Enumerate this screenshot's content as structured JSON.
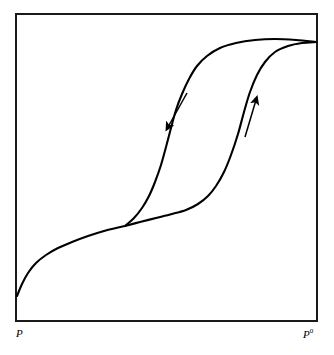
{
  "figure": {
    "type": "adsorption-isotherm-hysteresis",
    "background_color": "#ffffff",
    "line_color": "#000000",
    "frame_color": "#1a1a1a",
    "axis_labels": {
      "x_start": "P",
      "x_end_base": "P",
      "x_end_superscript": "0"
    }
  },
  "chart_data": {
    "type": "line",
    "title": "",
    "subtitle": "",
    "xlabel": "",
    "ylabel": "",
    "xlim": [
      0,
      1
    ],
    "ylim": [
      0,
      1
    ],
    "grid": false,
    "legend": null,
    "axis_tick_labels": {
      "x": [
        "P",
        "P0"
      ],
      "y": []
    },
    "frame": {
      "left_px": 16,
      "top_px": 14,
      "right_px": 317,
      "bottom_px": 321,
      "border_width_px": 2
    },
    "series": [
      {
        "name": "common-low-pressure-branch",
        "role": "shared",
        "description": "Shared low relative-pressure uptake curve rising from origin region to the hysteresis split point",
        "points_px": [
          [
            17,
            296
          ],
          [
            22,
            284
          ],
          [
            28,
            273
          ],
          [
            36,
            263
          ],
          [
            46,
            255
          ],
          [
            58,
            248
          ],
          [
            72,
            242
          ],
          [
            88,
            236
          ],
          [
            104,
            231
          ],
          [
            116,
            228
          ],
          [
            125,
            226
          ]
        ]
      },
      {
        "name": "adsorption-branch",
        "role": "adsorption",
        "arrow_direction": "up",
        "description": "Lower/right branch: gradual rise then steep capillary condensation step, joining the plateau near P0",
        "points_px": [
          [
            125,
            226
          ],
          [
            140,
            222
          ],
          [
            156,
            218
          ],
          [
            172,
            214
          ],
          [
            186,
            210
          ],
          [
            198,
            204
          ],
          [
            208,
            196
          ],
          [
            216,
            186
          ],
          [
            224,
            172
          ],
          [
            231,
            155
          ],
          [
            238,
            134
          ],
          [
            244,
            112
          ],
          [
            250,
            92
          ],
          [
            257,
            75
          ],
          [
            265,
            62
          ],
          [
            275,
            52
          ],
          [
            288,
            46
          ],
          [
            302,
            43
          ],
          [
            316,
            42
          ]
        ]
      },
      {
        "name": "desorption-branch",
        "role": "desorption",
        "arrow_direction": "down",
        "description": "Upper/left branch: steep evaporation step at lower relative pressure, flattening into the plateau",
        "points_px": [
          [
            125,
            226
          ],
          [
            134,
            218
          ],
          [
            142,
            208
          ],
          [
            149,
            196
          ],
          [
            155,
            182
          ],
          [
            161,
            165
          ],
          [
            166,
            147
          ],
          [
            171,
            128
          ],
          [
            176,
            110
          ],
          [
            182,
            94
          ],
          [
            189,
            79
          ],
          [
            197,
            66
          ],
          [
            207,
            56
          ],
          [
            220,
            48
          ],
          [
            236,
            43
          ],
          [
            255,
            40
          ],
          [
            275,
            39
          ],
          [
            296,
            40
          ],
          [
            316,
            42
          ]
        ]
      }
    ],
    "annotations": [
      {
        "name": "desorption-arrow",
        "label": "",
        "glyph": "down-arrow",
        "from_px": [
          187,
          93
        ],
        "to_px": [
          168,
          127
        ]
      },
      {
        "name": "adsorption-arrow",
        "label": "",
        "glyph": "up-arrow",
        "from_px": [
          245,
          137
        ],
        "to_px": [
          256,
          100
        ]
      }
    ]
  }
}
